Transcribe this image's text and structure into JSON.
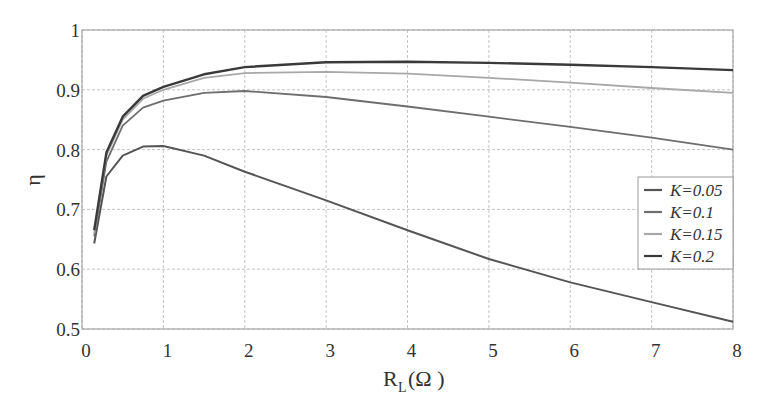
{
  "chart_data": {
    "type": "line",
    "title": "",
    "xlabel": "R_L(Ω)",
    "ylabel": "η",
    "xlim": [
      0,
      8
    ],
    "ylim": [
      0.5,
      1
    ],
    "grid": true,
    "legend_position": "lower right (inside)",
    "x_ticks": [
      "0",
      "1",
      "2",
      "3",
      "4",
      "5",
      "6",
      "7",
      "8"
    ],
    "y_ticks": [
      "0.5",
      "0.6",
      "0.7",
      "0.8",
      "0.9",
      "1"
    ],
    "x": [
      0.15,
      0.3,
      0.5,
      0.75,
      1,
      1.5,
      2,
      3,
      4,
      5,
      6,
      7,
      8
    ],
    "series": [
      {
        "name": "K=0.05",
        "color": "#555555",
        "width": 2,
        "values": [
          0.643,
          0.755,
          0.79,
          0.805,
          0.806,
          0.79,
          0.763,
          0.715,
          0.665,
          0.617,
          0.578,
          0.545,
          0.512
        ]
      },
      {
        "name": "K=0.1",
        "color": "#6e6e6e",
        "width": 1.8,
        "values": [
          0.655,
          0.78,
          0.84,
          0.87,
          0.882,
          0.895,
          0.898,
          0.888,
          0.872,
          0.855,
          0.838,
          0.82,
          0.8
        ]
      },
      {
        "name": "K=0.15",
        "color": "#a8a8a8",
        "width": 1.8,
        "values": [
          0.66,
          0.79,
          0.85,
          0.885,
          0.9,
          0.92,
          0.928,
          0.93,
          0.927,
          0.92,
          0.912,
          0.903,
          0.895
        ]
      },
      {
        "name": "K=0.2",
        "color": "#3a3a3a",
        "width": 2.4,
        "values": [
          0.665,
          0.795,
          0.855,
          0.89,
          0.905,
          0.926,
          0.938,
          0.946,
          0.947,
          0.945,
          0.942,
          0.938,
          0.933
        ]
      }
    ]
  },
  "axes": {
    "xlabel_main": "R",
    "xlabel_sub": "L",
    "xlabel_unit": "(Ω )",
    "ylabel": "η"
  },
  "legend": [
    {
      "label": "K=0.05",
      "color": "#555555"
    },
    {
      "label": "K=0.1",
      "color": "#6e6e6e"
    },
    {
      "label": "K=0.15",
      "color": "#a8a8a8"
    },
    {
      "label": "K=0.2",
      "color": "#3a3a3a"
    }
  ]
}
